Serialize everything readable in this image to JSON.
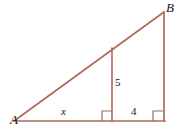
{
  "figure": {
    "type": "geometry-diagram",
    "colors": {
      "stroke": "#b3675a",
      "right_angle_marker": "#9c6a5e",
      "label_text": "#141414",
      "background": "#ffffff"
    },
    "stroke_width": 1.6,
    "vertices": {
      "A": {
        "x": 14,
        "y": 121
      },
      "B": {
        "x": 164,
        "y": 12
      },
      "C": {
        "x": 164,
        "y": 121
      },
      "D": {
        "x": 112,
        "y": 121
      },
      "E": {
        "x": 112,
        "y": 48
      }
    },
    "segments": [
      {
        "name": "hypotenuse-AB",
        "from": "A",
        "to": "B"
      },
      {
        "name": "base-AC",
        "from": "A",
        "to": "C"
      },
      {
        "name": "right-leg-BC",
        "from": "B",
        "to": "C"
      },
      {
        "name": "interior-altitude-DE",
        "from": "D",
        "to": "E"
      }
    ],
    "right_angles": [
      {
        "name": "right-angle-at-D",
        "x": 102,
        "y": 111,
        "size": 10
      },
      {
        "name": "right-angle-at-C",
        "x": 153,
        "y": 111,
        "size": 10
      }
    ],
    "labels": {
      "vertex_a": "A",
      "vertex_b": "B",
      "side_x": "x",
      "side_5": "5",
      "side_4": "4"
    }
  }
}
